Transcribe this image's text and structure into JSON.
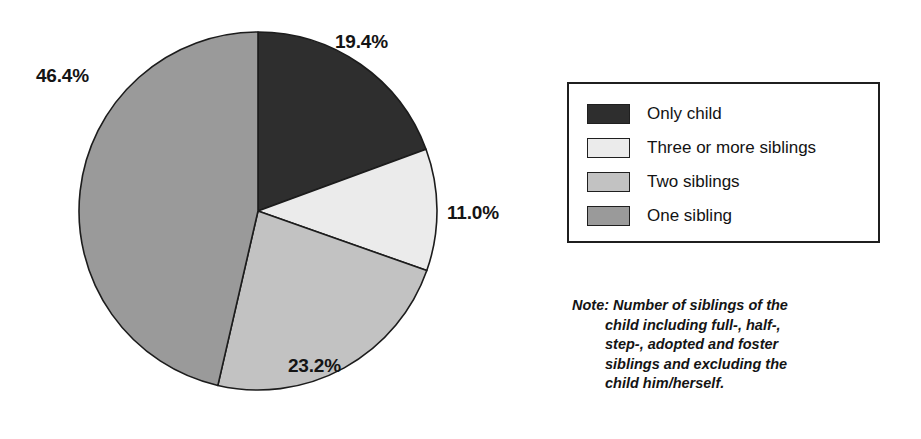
{
  "chart_data": {
    "type": "pie",
    "title": "",
    "subtitle": "",
    "xlabel": "",
    "ylabel": "",
    "legend_position": "right",
    "grid": false,
    "start_angle_deg": 0,
    "direction": "clockwise",
    "units": "percent",
    "categories": [
      "Only child",
      "Three or more siblings",
      "Two siblings",
      "One sibling"
    ],
    "values": [
      19.4,
      11.0,
      23.2,
      46.4
    ],
    "colors": [
      "#2e2e2e",
      "#ebebeb",
      "#c2c2c2",
      "#9a9a9a"
    ],
    "data_labels": [
      "19.4%",
      "11.0%",
      "23.2%",
      "46.4%"
    ],
    "slices": [
      {
        "label": "Only child",
        "value": 19.4,
        "display": "19.4%",
        "color": "#2e2e2e"
      },
      {
        "label": "Three or more siblings",
        "value": 11.0,
        "display": "11.0%",
        "color": "#ebebeb"
      },
      {
        "label": "Two siblings",
        "value": 23.2,
        "display": "23.2%",
        "color": "#c2c2c2"
      },
      {
        "label": "One sibling",
        "value": 46.4,
        "display": "46.4%",
        "color": "#9a9a9a"
      }
    ]
  },
  "legend": {
    "items": [
      {
        "label": "Only child",
        "color": "#2e2e2e"
      },
      {
        "label": "Three or more siblings",
        "color": "#ebebeb"
      },
      {
        "label": "Two siblings",
        "color": "#c2c2c2"
      },
      {
        "label": "One sibling",
        "color": "#9a9a9a"
      }
    ]
  },
  "note": {
    "lines": [
      "Note: Number of siblings of the",
      "child including full-, half-,",
      "step-, adopted and foster",
      "siblings and excluding the",
      "child him/herself."
    ]
  },
  "geometry": {
    "center_x": 258,
    "center_y": 211,
    "radius": 179
  }
}
